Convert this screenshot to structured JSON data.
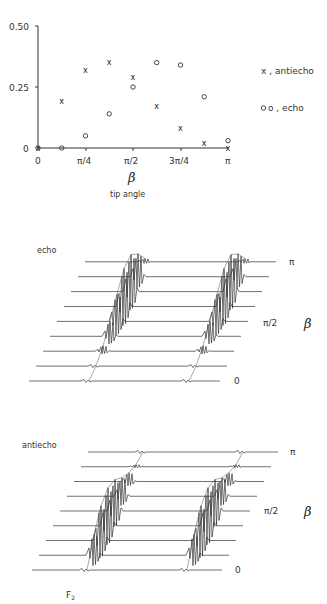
{
  "chart_data": [
    {
      "type": "scatter",
      "title": "",
      "xlabel": "tip angle",
      "xsymbol": "β",
      "ylabel": "",
      "xlim": [
        0,
        3.14159
      ],
      "ylim": [
        0,
        0.5
      ],
      "x_tick_labels": [
        "0",
        "π/4",
        "π/2",
        "3π/4",
        "π"
      ],
      "y_tick_labels": [
        "0",
        "0.25",
        "0.50"
      ],
      "grid": false,
      "legend_position": "right",
      "series": [
        {
          "name": "antiecho",
          "marker": "x",
          "legend_label": "x , antiecho",
          "x_fraction_of_pi": [
            0,
            0.125,
            0.25,
            0.375,
            0.5,
            0.625,
            0.75,
            0.875,
            1.0
          ],
          "values": [
            0.0,
            0.19,
            0.32,
            0.35,
            0.29,
            0.17,
            0.08,
            0.02,
            0.0
          ]
        },
        {
          "name": "echo",
          "marker": "o",
          "legend_label": "o , echo",
          "x_fraction_of_pi": [
            0,
            0.125,
            0.25,
            0.375,
            0.5,
            0.625,
            0.75,
            0.875,
            1.0
          ],
          "values": [
            0.0,
            0.0,
            0.05,
            0.14,
            0.25,
            0.35,
            0.34,
            0.21,
            0.03
          ]
        }
      ]
    },
    {
      "type": "stacked_spectra",
      "title": "echo",
      "xlabel": "F2",
      "ylabel": "β",
      "y_tick_labels": [
        "0",
        "π/2",
        "π"
      ],
      "n_traces": 9,
      "beta_fraction_of_pi": [
        0,
        0.125,
        0.25,
        0.375,
        0.5,
        0.625,
        0.75,
        0.875,
        1.0
      ],
      "relative_intensity": [
        0.0,
        0.0,
        0.05,
        0.14,
        0.25,
        0.35,
        0.34,
        0.21,
        0.03
      ]
    },
    {
      "type": "stacked_spectra",
      "title": "antiecho",
      "xlabel": "F2",
      "ylabel": "β",
      "y_tick_labels": [
        "0",
        "π/2",
        "π"
      ],
      "n_traces": 9,
      "beta_fraction_of_pi": [
        0,
        0.125,
        0.25,
        0.375,
        0.5,
        0.625,
        0.75,
        0.875,
        1.0
      ],
      "relative_intensity": [
        0.0,
        0.19,
        0.32,
        0.35,
        0.29,
        0.17,
        0.08,
        0.02,
        0.0
      ]
    }
  ],
  "labels": {
    "scatter_y_ticks": [
      "0.50",
      "0.25",
      "0"
    ],
    "scatter_x_ticks": [
      "0",
      "π/4",
      "π/2",
      "3π/4",
      "π"
    ],
    "beta": "β",
    "tip_angle": "tip angle",
    "legend_antiecho": "x , antiecho",
    "legend_echo": "o , echo",
    "echo_title": "echo",
    "antiecho_title": "antiecho",
    "tick_pi": "π",
    "tick_pi_half": "π/2",
    "tick_zero": "0",
    "f2": "F",
    "f2_sub": "2"
  }
}
